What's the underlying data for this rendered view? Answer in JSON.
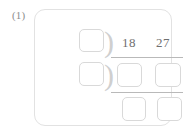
{
  "problem": {
    "label": "(1)",
    "type": "long-division",
    "dividend_digits": [
      "18",
      "27"
    ],
    "dividend": "1827",
    "divisor_value": "",
    "bracket_glyph": ")",
    "blank_boxes": {
      "divisor": "",
      "quotient_left": "",
      "work_middle_1": "",
      "work_middle_2": "",
      "work_bottom_1": "",
      "work_bottom_2": ""
    }
  },
  "colors": {
    "card_border": "#e2e2e2",
    "box_border": "#d9d9d9",
    "rule": "#b9b9b9",
    "digit_text": "#6f6f6f",
    "label_text": "#8d8d8d",
    "bracket": "#cfcfcf",
    "background": "#ffffff"
  }
}
